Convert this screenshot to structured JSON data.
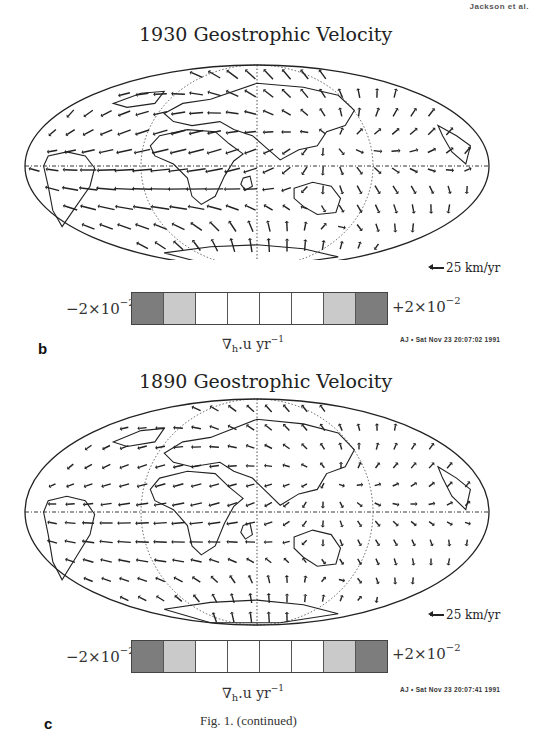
{
  "page": {
    "running_header": "Jackson et al.",
    "caption": "Fig. 1.  (continued)"
  },
  "panels": [
    {
      "letter": "b",
      "title": "1930 Geostrophic Velocity",
      "scale_label": "25 km/yr",
      "colorbar": {
        "min_label": "−2×10",
        "min_exp": "−2",
        "max_label": "+2×10",
        "max_exp": "−2",
        "units_main": "∇",
        "units_sub": "h",
        "units_rest": ".u  yr",
        "units_exp": "−1",
        "cells": [
          "#7d7d7d",
          "#cacaca",
          "#ffffff",
          "#ffffff",
          "#ffffff",
          "#ffffff",
          "#cacaca",
          "#7d7d7d"
        ]
      },
      "stamp": "AJ • Sat Nov 23 20:07:02 1991",
      "flow_strength": 1.0
    },
    {
      "letter": "c",
      "title": "1890 Geostrophic Velocity",
      "scale_label": "25 km/yr",
      "colorbar": {
        "min_label": "−2×10",
        "min_exp": "−2",
        "max_label": "+2×10",
        "max_exp": "−2",
        "units_main": "∇",
        "units_sub": "h",
        "units_rest": ".u  yr",
        "units_exp": "−1",
        "cells": [
          "#7d7d7d",
          "#cacaca",
          "#ffffff",
          "#ffffff",
          "#ffffff",
          "#ffffff",
          "#cacaca",
          "#7d7d7d"
        ]
      },
      "stamp": "AJ • Sat Nov 23 20:07:41 1991",
      "flow_strength": 0.6
    }
  ],
  "colors": {
    "ink": "#222222",
    "dark_bin": "#7d7d7d",
    "light_bin": "#cacaca"
  }
}
